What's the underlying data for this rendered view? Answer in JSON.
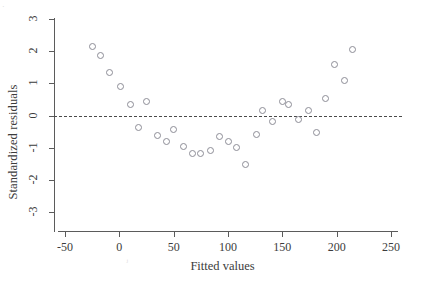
{
  "chart_data": {
    "type": "scatter",
    "title": "",
    "xlabel": "Fitted values",
    "ylabel": "Standardized residuals",
    "xlim": [
      -60,
      260
    ],
    "ylim": [
      -3,
      3
    ],
    "xticks": [
      -50,
      0,
      50,
      100,
      150,
      200,
      250
    ],
    "xticklabels": [
      "-50",
      "0",
      "50",
      "100",
      "150",
      "200",
      "250"
    ],
    "yticks": [
      -3,
      -2,
      -1,
      0,
      1,
      2,
      3
    ],
    "yticklabels": [
      "-3",
      "-2",
      "-1",
      "0",
      "1",
      "2",
      "3"
    ],
    "grid": false,
    "legend": null,
    "reference_lines": [
      {
        "name": "zero-residual-line",
        "axis": "horizontal",
        "value": 0,
        "style": "dashed"
      }
    ],
    "marker": {
      "shape": "circle",
      "filled": false,
      "edge_color": "#8d8d96",
      "size": 5
    },
    "series": [
      {
        "name": "residuals",
        "points": [
          {
            "x": -25,
            "y": 2.13
          },
          {
            "x": -17,
            "y": 1.86
          },
          {
            "x": -9,
            "y": 1.33
          },
          {
            "x": 1,
            "y": 0.9
          },
          {
            "x": 10,
            "y": 0.35
          },
          {
            "x": 25,
            "y": 0.43
          },
          {
            "x": 18,
            "y": -0.38
          },
          {
            "x": 35,
            "y": -0.62
          },
          {
            "x": 43,
            "y": -0.8
          },
          {
            "x": 50,
            "y": -0.44
          },
          {
            "x": 59,
            "y": -0.95
          },
          {
            "x": 67,
            "y": -1.19
          },
          {
            "x": 75,
            "y": -1.19
          },
          {
            "x": 84,
            "y": -1.1
          },
          {
            "x": 92,
            "y": -0.66
          },
          {
            "x": 100,
            "y": -0.82
          },
          {
            "x": 108,
            "y": -0.99
          },
          {
            "x": 116,
            "y": -1.53
          },
          {
            "x": 126,
            "y": -0.58
          },
          {
            "x": 132,
            "y": 0.14
          },
          {
            "x": 141,
            "y": -0.19
          },
          {
            "x": 150,
            "y": 0.44
          },
          {
            "x": 156,
            "y": 0.33
          },
          {
            "x": 165,
            "y": -0.11
          },
          {
            "x": 174,
            "y": 0.17
          },
          {
            "x": 181,
            "y": -0.52
          },
          {
            "x": 190,
            "y": 0.53
          },
          {
            "x": 198,
            "y": 1.59
          },
          {
            "x": 207,
            "y": 1.08
          },
          {
            "x": 215,
            "y": 2.05
          }
        ]
      }
    ]
  },
  "artifacts": [
    {
      "name": "page-speck-top-left",
      "glyph": "·",
      "left": 2,
      "top": 2
    },
    {
      "name": "page-speck-bottom",
      "glyph": "ⱼ",
      "left": 126,
      "top": 255
    }
  ]
}
